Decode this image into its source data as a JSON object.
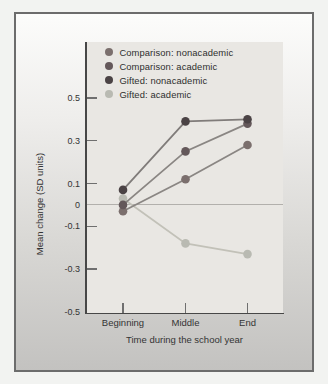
{
  "figure": {
    "kind": "framed textbook line chart, grayscale scan",
    "panel_border_color": "#6c6c6c",
    "axis_color": "#474747",
    "zero_line_color": "#b2b0ac",
    "plot_background": "#e9e7e3"
  },
  "chart_data": {
    "type": "line",
    "title": "",
    "xlabel": "Time during the school year",
    "ylabel": "Mean change (SD units)",
    "categories": [
      "Beginning",
      "Middle",
      "End"
    ],
    "series": [
      {
        "name": "Comparison: nonacademic",
        "values": [
          -0.03,
          0.12,
          0.28
        ],
        "color": "#7b6f6d",
        "line_color": "#8a8683"
      },
      {
        "name": "Comparison: academic",
        "values": [
          0.0,
          0.25,
          0.38
        ],
        "color": "#64585a",
        "line_color": "#8a8683"
      },
      {
        "name": "Gifted: nonacademic",
        "values": [
          0.07,
          0.39,
          0.4
        ],
        "color": "#4b4345",
        "line_color": "#807c7a"
      },
      {
        "name": "Gifted: academic",
        "values": [
          0.03,
          -0.18,
          -0.23
        ],
        "color": "#b9bab2",
        "line_color": "#c2c1b8"
      }
    ],
    "ylim": [
      -0.5,
      0.5
    ],
    "y_tick_values": [
      0.5,
      0.3,
      0.1,
      0,
      -0.1,
      -0.3,
      -0.5
    ],
    "y_tick_labels": [
      "0.5",
      "0.3",
      "0.1",
      "0",
      "-0.1",
      "-0.3",
      "-0.5"
    ],
    "grid": "zero-line-only",
    "legend_position": "inside top-left of plot"
  }
}
